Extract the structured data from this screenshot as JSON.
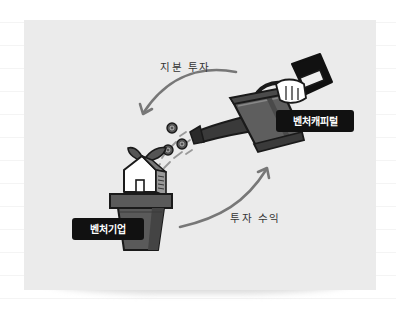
{
  "illustration": {
    "title": "Venture capital investment cycle",
    "arrows": {
      "top": {
        "label": "지분 투자",
        "direction": "from watering can to venture company"
      },
      "bottom": {
        "label": "투자 수익",
        "direction": "from venture company to venture capital"
      }
    },
    "badges": {
      "venture_capital": "벤처캐피털",
      "venture_company": "벤처기업"
    },
    "elements": {
      "watering_can": "watering-can-icon",
      "hand": "hand-icon",
      "sleeve": "sleeve-icon",
      "coins": "coin-icon",
      "plant_pot": "plant-pot-icon",
      "house": "house-icon",
      "sprout": "sprout-icon"
    },
    "colors": {
      "card_bg": "#ebebeb",
      "arrow": "#777777",
      "badge_bg": "#111111",
      "badge_text": "#ffffff",
      "pot": "#5a5a5a",
      "pot_shade": "#444444",
      "can": "#5e5e5e",
      "sleeve": "#1a1a1a",
      "outline": "#1a1a1a"
    }
  }
}
